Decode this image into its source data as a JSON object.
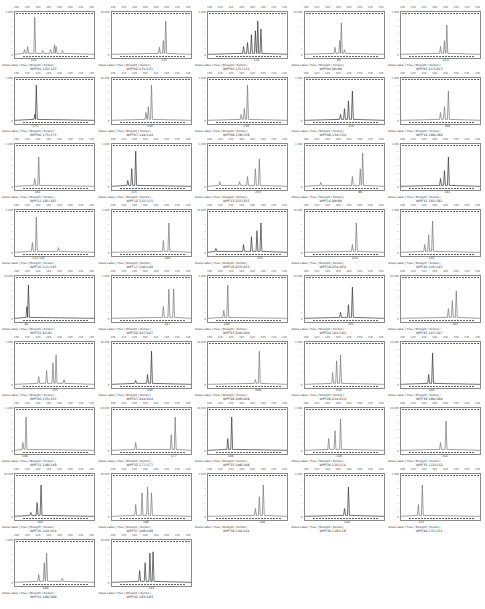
{
  "legend": {
    "label": "Allele Label",
    "trace": "True",
    "straight": "Straight",
    "sorted": "Sorted"
  },
  "chart_data": {
    "type": "line",
    "title": "",
    "layout": {
      "rows": 9,
      "cols": 5,
      "panels": 42
    },
    "panels": [
      {
        "sample": "WPF01.123/123",
        "allele": "123",
        "ymax": "1,000",
        "peaks": [
          [
            0.12,
            0.12
          ],
          [
            0.16,
            0.2
          ],
          [
            0.25,
            0.95
          ],
          [
            0.35,
            0.1
          ],
          [
            0.45,
            0.12
          ],
          [
            0.5,
            0.25
          ],
          [
            0.52,
            0.2
          ],
          [
            0.6,
            0.1
          ]
        ]
      },
      {
        "sample": "WPF02.131/131",
        "allele": "131",
        "ymax": "10,000",
        "peaks": [
          [
            0.6,
            0.18
          ],
          [
            0.65,
            0.35
          ],
          [
            0.68,
            0.85
          ]
        ]
      },
      {
        "sample": "WPF03.131/131",
        "allele": "131",
        "ymax": "1,000",
        "peaks": [
          [
            0.45,
            0.2
          ],
          [
            0.5,
            0.3
          ],
          [
            0.55,
            0.5
          ],
          [
            0.6,
            0.6
          ],
          [
            0.63,
            0.85
          ],
          [
            0.67,
            0.65
          ]
        ]
      },
      {
        "sample": "WPF04.90/90",
        "allele": "90",
        "ymax": "20,000",
        "peaks": [
          [
            0.38,
            0.18
          ],
          [
            0.44,
            0.35
          ],
          [
            0.46,
            0.8
          ],
          [
            0.5,
            0.12
          ]
        ]
      },
      {
        "sample": "WPF05.213/213",
        "allele": "213",
        "ymax": "1,000",
        "peaks": [
          [
            0.5,
            0.2
          ],
          [
            0.55,
            0.35
          ],
          [
            0.58,
            0.75
          ]
        ]
      },
      {
        "sample": "WPF06.175/175",
        "allele": "175",
        "ymax": "2,000",
        "peaks": [
          [
            0.25,
            0.15
          ],
          [
            0.27,
            0.9
          ]
        ]
      },
      {
        "sample": "WPF07.144/144",
        "allele": "144",
        "ymax": "20,000",
        "peaks": [
          [
            0.43,
            0.2
          ],
          [
            0.46,
            0.35
          ],
          [
            0.5,
            0.9
          ]
        ]
      },
      {
        "sample": "WPF08.158/158",
        "allele": "158",
        "ymax": "1,000",
        "peaks": [
          [
            0.42,
            0.15
          ],
          [
            0.46,
            0.3
          ],
          [
            0.5,
            0.9
          ]
        ]
      },
      {
        "sample": "WPF09.134/134",
        "allele": "134",
        "ymax": "2,000",
        "peaks": [
          [
            0.45,
            0.15
          ],
          [
            0.5,
            0.3
          ],
          [
            0.55,
            0.5
          ],
          [
            0.6,
            0.75
          ]
        ]
      },
      {
        "sample": "WPF10.188/188",
        "allele": "188",
        "ymax": "1,000",
        "peaks": [
          [
            0.5,
            0.2
          ],
          [
            0.55,
            0.35
          ],
          [
            0.6,
            0.75
          ]
        ]
      },
      {
        "sample": "WPF11.181/181",
        "allele": "181",
        "ymax": "2,000",
        "peaks": [
          [
            0.25,
            0.2
          ],
          [
            0.3,
            0.75
          ]
        ]
      },
      {
        "sample": "WPF12.115/115",
        "allele": "115",
        "ymax": "1,000",
        "peaks": [
          [
            0.2,
            0.15
          ],
          [
            0.25,
            0.45
          ],
          [
            0.3,
            0.9
          ]
        ]
      },
      {
        "sample": "WPF13.255/255",
        "allele": "255",
        "ymax": "1,000",
        "peaks": [
          [
            0.15,
            0.12
          ],
          [
            0.4,
            0.12
          ],
          [
            0.5,
            0.25
          ],
          [
            0.6,
            0.45
          ],
          [
            0.65,
            0.7
          ]
        ]
      },
      {
        "sample": "WPF14.99/99",
        "allele": "99",
        "ymax": "1,000",
        "peaks": [
          [
            0.2,
            0.1
          ],
          [
            0.6,
            0.25
          ],
          [
            0.7,
            0.45
          ],
          [
            0.73,
            0.85
          ]
        ]
      },
      {
        "sample": "WPF15.181/181",
        "allele": "181",
        "ymax": "1,000",
        "peaks": [
          [
            0.5,
            0.2
          ],
          [
            0.55,
            0.4
          ],
          [
            0.6,
            0.75
          ]
        ]
      },
      {
        "sample": "WPF16.111/125",
        "allele": "111 125",
        "ymax": "1,000",
        "peaks": [
          [
            0.22,
            0.25
          ],
          [
            0.27,
            0.9
          ],
          [
            0.55,
            0.12
          ]
        ]
      },
      {
        "sample": "WPF17.140/140",
        "allele": "140",
        "ymax": "1,000",
        "peaks": [
          [
            0.65,
            0.3
          ],
          [
            0.72,
            0.75
          ]
        ]
      },
      {
        "sample": "WPF18.255/255",
        "allele": "255",
        "ymax": "10,000",
        "peaks": [
          [
            0.1,
            0.1
          ],
          [
            0.45,
            0.2
          ],
          [
            0.55,
            0.4
          ],
          [
            0.62,
            0.55
          ],
          [
            0.67,
            0.75
          ]
        ]
      },
      {
        "sample": "WPF19.254/254",
        "allele": "254",
        "ymax": "10,000",
        "peaks": [
          [
            0.6,
            0.2
          ],
          [
            0.65,
            0.75
          ]
        ]
      },
      {
        "sample": "WPF20.145/145",
        "allele": "145",
        "ymax": "1,000",
        "peaks": [
          [
            0.3,
            0.2
          ],
          [
            0.35,
            0.45
          ],
          [
            0.4,
            0.8
          ]
        ]
      },
      {
        "sample": "WPF21.91/91",
        "allele": "91",
        "ymax": "10,000",
        "peaks": [
          [
            0.15,
            0.3
          ],
          [
            0.17,
            0.85
          ]
        ]
      },
      {
        "sample": "WPF22.247/247",
        "allele": "247",
        "ymax": "1,000",
        "peaks": [
          [
            0.65,
            0.3
          ],
          [
            0.72,
            0.75
          ],
          [
            0.78,
            0.75
          ]
        ]
      },
      {
        "sample": "WPF23.240/240",
        "allele": "240",
        "ymax": "1,000",
        "peaks": [
          [
            0.2,
            0.2
          ],
          [
            0.25,
            0.85
          ]
        ]
      },
      {
        "sample": "WPF24.101/101",
        "allele": "101",
        "ymax": "20,000",
        "peaks": [
          [
            0.45,
            0.15
          ],
          [
            0.55,
            0.35
          ],
          [
            0.6,
            0.8
          ]
        ]
      },
      {
        "sample": "WPF25.107/107",
        "allele": "107",
        "ymax": "10,000",
        "peaks": [
          [
            0.6,
            0.25
          ],
          [
            0.65,
            0.45
          ],
          [
            0.7,
            0.7
          ]
        ]
      },
      {
        "sample": "WPF26.155/155",
        "allele": "155",
        "ymax": "2,000",
        "peaks": [
          [
            0.3,
            0.2
          ],
          [
            0.4,
            0.35
          ],
          [
            0.48,
            0.55
          ],
          [
            0.52,
            0.75
          ],
          [
            0.62,
            0.12
          ]
        ]
      },
      {
        "sample": "WPF27.244/244",
        "allele": "244",
        "ymax": "20,000",
        "peaks": [
          [
            0.3,
            0.1
          ],
          [
            0.45,
            0.25
          ],
          [
            0.5,
            0.85
          ]
        ]
      },
      {
        "sample": "WPF28.209/209",
        "allele": "209",
        "ymax": "20,000",
        "peaks": [
          [
            0.6,
            0.12
          ],
          [
            0.65,
            0.85
          ]
        ]
      },
      {
        "sample": "WPF29.214/214",
        "allele": "214",
        "ymax": "1,000",
        "peaks": [
          [
            0.35,
            0.3
          ],
          [
            0.4,
            0.6
          ],
          [
            0.45,
            0.75
          ]
        ]
      },
      {
        "sample": "WPF30.180/180",
        "allele": "180",
        "ymax": "10,000",
        "peaks": [
          [
            0.35,
            0.25
          ],
          [
            0.4,
            0.8
          ]
        ]
      },
      {
        "sample": "WPF31.148/148",
        "allele": "148",
        "ymax": "1,000",
        "peaks": [
          [
            0.1,
            0.2
          ],
          [
            0.14,
            0.85
          ]
        ]
      },
      {
        "sample": "WPF32.177/177",
        "allele": "177",
        "ymax": "10,000",
        "peaks": [
          [
            0.3,
            0.2
          ],
          [
            0.75,
            0.4
          ],
          [
            0.8,
            0.85
          ]
        ]
      },
      {
        "sample": "WPF33.108/108",
        "allele": "108",
        "ymax": "10,000",
        "peaks": [
          [
            0.25,
            0.3
          ],
          [
            0.3,
            0.85
          ]
        ]
      },
      {
        "sample": "WPF34.116/116",
        "allele": "116",
        "ymax": "2,000",
        "peaks": [
          [
            0.3,
            0.3
          ],
          [
            0.38,
            0.5
          ],
          [
            0.45,
            0.8
          ]
        ]
      },
      {
        "sample": "WPF35.112/112",
        "allele": "112",
        "ymax": "10,000",
        "peaks": [
          [
            0.5,
            0.2
          ],
          [
            0.57,
            0.75
          ]
        ]
      },
      {
        "sample": "WPF36.164/164",
        "allele": "164",
        "ymax": "20,000",
        "peaks": [
          [
            0.2,
            0.1
          ],
          [
            0.28,
            0.35
          ],
          [
            0.33,
            0.8
          ]
        ]
      },
      {
        "sample": "WPF37.108/108",
        "allele": "108",
        "ymax": "10,000",
        "peaks": [
          [
            0.3,
            0.3
          ],
          [
            0.38,
            0.6
          ],
          [
            0.45,
            0.75
          ],
          [
            0.5,
            0.6
          ]
        ]
      },
      {
        "sample": "WPF38.144/144",
        "allele": "144",
        "ymax": "1,000",
        "peaks": [
          [
            0.6,
            0.2
          ],
          [
            0.65,
            0.5
          ],
          [
            0.7,
            0.8
          ]
        ]
      },
      {
        "sample": "WPF39.118/118",
        "allele": "118",
        "ymax": "1,000",
        "peaks": [
          [
            0.5,
            0.2
          ],
          [
            0.55,
            0.75
          ]
        ]
      },
      {
        "sample": "WPF40.131/131",
        "allele": "131",
        "ymax": "1,000",
        "peaks": [
          [
            0.22,
            0.3
          ],
          [
            0.27,
            0.8
          ]
        ]
      },
      {
        "sample": "WPF41.180/180",
        "allele": "180",
        "ymax": "3,000",
        "peaks": [
          [
            0.3,
            0.2
          ],
          [
            0.37,
            0.5
          ],
          [
            0.4,
            0.75
          ],
          [
            0.6,
            0.1
          ]
        ]
      },
      {
        "sample": "WPF42.183/183",
        "allele": "183",
        "ymax": "10,000",
        "peaks": [
          [
            0.35,
            0.3
          ],
          [
            0.42,
            0.5
          ],
          [
            0.48,
            0.75
          ],
          [
            0.52,
            0.78
          ]
        ]
      }
    ]
  }
}
